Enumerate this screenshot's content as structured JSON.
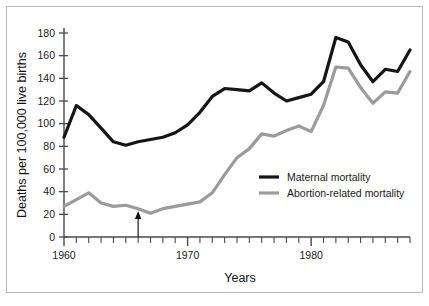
{
  "figure": {
    "background_color": "#ffffff",
    "border_color": "#b9b9b9"
  },
  "chart_data": {
    "type": "line",
    "title": "",
    "xlabel": "Years",
    "ylabel": "Deaths per 100,000 live births",
    "xlim": [
      1960,
      1988
    ],
    "ylim": [
      0,
      180
    ],
    "grid": false,
    "legend_position": "inside-right",
    "x": [
      1960,
      1961,
      1962,
      1963,
      1964,
      1965,
      1966,
      1967,
      1968,
      1969,
      1970,
      1971,
      1972,
      1973,
      1974,
      1975,
      1976,
      1977,
      1978,
      1979,
      1980,
      1981,
      1982,
      1983,
      1984,
      1985,
      1986,
      1987,
      1988
    ],
    "x_tick_labels": [
      "1960",
      "1970",
      "1980"
    ],
    "x_tick_values": [
      1960,
      1970,
      1980
    ],
    "y_tick_labels": [
      "0",
      "20",
      "40",
      "60",
      "80",
      "100",
      "120",
      "140",
      "160",
      "180"
    ],
    "y_tick_values": [
      0,
      20,
      40,
      60,
      80,
      100,
      120,
      140,
      160,
      180
    ],
    "series": [
      {
        "name": "Maternal mortality",
        "color": "#151515",
        "line_width": 3.2,
        "values": [
          88,
          116,
          108,
          96,
          84,
          81,
          84,
          86,
          88,
          92,
          99,
          110,
          124,
          131,
          130,
          129,
          136,
          127,
          120,
          123,
          126,
          130,
          136,
          143,
          133,
          128,
          126,
          127,
          131
        ]
      },
      {
        "name": "Abortion-related mortality",
        "color": "#9b9b9b",
        "line_width": 3.2,
        "values": [
          27,
          33,
          39,
          30,
          27,
          28,
          25,
          21,
          25,
          27,
          29,
          31,
          39,
          55,
          70,
          78,
          91,
          89,
          94,
          98,
          93,
          87,
          90,
          98,
          108,
          109,
          106,
          106,
          108
        ]
      }
    ],
    "series_tail": {
      "note": "continues to 1988",
      "x": [
        1981,
        1982,
        1983,
        1984,
        1985,
        1986,
        1987,
        1988
      ],
      "maternal": [
        137,
        176,
        172,
        152,
        137,
        148,
        146,
        165
      ],
      "abortion": [
        116,
        150,
        149,
        132,
        118,
        128,
        127,
        146
      ]
    },
    "annotations": [
      {
        "type": "arrow",
        "label": "",
        "x": 1966,
        "y": 0,
        "direction": "up"
      }
    ]
  },
  "legend": {
    "items": [
      {
        "label": "Maternal mortality",
        "color": "#151515"
      },
      {
        "label": "Abortion-related mortality",
        "color": "#9b9b9b"
      }
    ]
  },
  "axes": {
    "y_title": "Deaths per 100,000 live births",
    "x_title": "Years"
  }
}
